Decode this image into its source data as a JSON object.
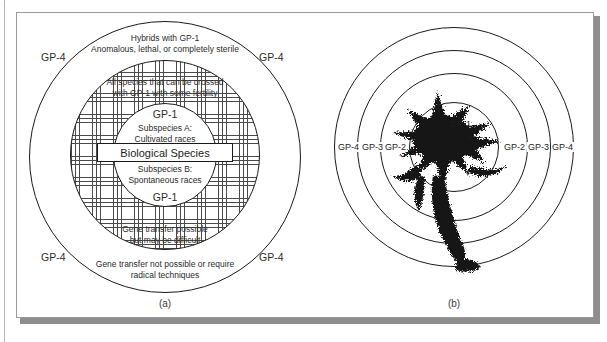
{
  "figure": {
    "panels": [
      {
        "caption": "(a)",
        "name": "gene-pool-concept-diagram",
        "zones": {
          "outer_ring_label": "GP-4",
          "outer_ring_text_line1": "Hybrids with GP-1",
          "outer_ring_text_line2": "Anomalous, lethal, or completely sterile",
          "outer_ring_bottom_line1": "Gene transfer not possible or require",
          "outer_ring_bottom_line2": "radical techniques",
          "hatched_top_line1": "All species that can be crossed",
          "hatched_top_line2": "with GP-1 with some fertility",
          "hatched_bottom_line1": "Gene transfer possible",
          "hatched_bottom_line2": "but may be difficult",
          "core_label_top": "GP-1",
          "core_label_bottom": "GP-1",
          "subspecies_a_line1": "Subspecies A:",
          "subspecies_a_line2": "Cultivated races",
          "subspecies_b_line1": "Subspecies B:",
          "subspecies_b_line2": "Spontaneous races",
          "biological_species": "Biological Species"
        }
      },
      {
        "caption": "(b)",
        "name": "gene-pool-target-diagram",
        "rings": [
          "GP-1",
          "GP-2",
          "GP-3",
          "GP-4"
        ],
        "labels_left": [
          "GP-4",
          "GP-3",
          "GP-2"
        ],
        "labels_right": [
          "GP-2",
          "GP-3",
          "GP-4"
        ],
        "center_label": "GP-1"
      }
    ]
  },
  "scan": {
    "top_bleed_text": "·   ·   ·   ·   ·"
  },
  "colors": {
    "ink": "#1a1a1a",
    "paper": "#ffffff",
    "frame": "#9a9a9a",
    "shadow": "#8e8e8e",
    "hatch": "#4a4a4a"
  }
}
